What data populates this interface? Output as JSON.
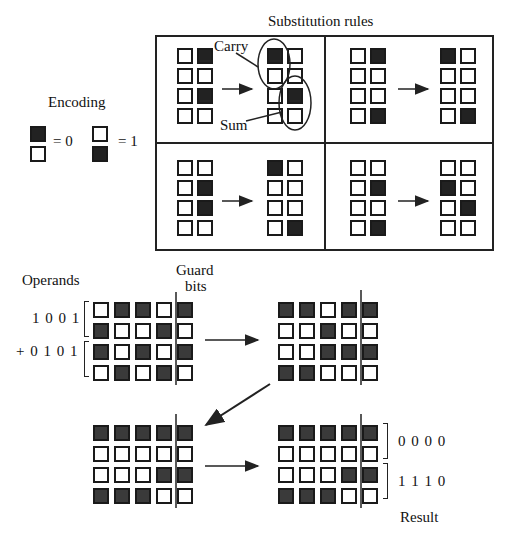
{
  "substitution_rules": {
    "title": "Substitution rules",
    "rules": [
      {
        "name": "top-left",
        "input": [
          [
            "W",
            "D"
          ],
          [
            "W",
            "W"
          ],
          [
            "W",
            "D"
          ],
          [
            "W",
            "W"
          ]
        ],
        "output": [
          [
            "D",
            "W"
          ],
          [
            "W",
            "W"
          ],
          [
            "W",
            "D"
          ],
          [
            "W",
            "W"
          ]
        ],
        "annotations": {
          "carry": "Carry",
          "sum": "Sum"
        }
      },
      {
        "name": "top-right",
        "input": [
          [
            "W",
            "D"
          ],
          [
            "W",
            "W"
          ],
          [
            "W",
            "W"
          ],
          [
            "W",
            "D"
          ]
        ],
        "output": [
          [
            "D",
            "W"
          ],
          [
            "W",
            "W"
          ],
          [
            "W",
            "W"
          ],
          [
            "W",
            "D"
          ]
        ]
      },
      {
        "name": "bottom-left",
        "input": [
          [
            "W",
            "W"
          ],
          [
            "W",
            "D"
          ],
          [
            "W",
            "D"
          ],
          [
            "W",
            "W"
          ]
        ],
        "output": [
          [
            "D",
            "W"
          ],
          [
            "W",
            "W"
          ],
          [
            "W",
            "W"
          ],
          [
            "W",
            "D"
          ]
        ]
      },
      {
        "name": "bottom-right",
        "input": [
          [
            "W",
            "W"
          ],
          [
            "W",
            "D"
          ],
          [
            "W",
            "W"
          ],
          [
            "W",
            "D"
          ]
        ],
        "output": [
          [
            "W",
            "W"
          ],
          [
            "D",
            "W"
          ],
          [
            "W",
            "D"
          ],
          [
            "W",
            "W"
          ]
        ]
      }
    ]
  },
  "encoding": {
    "title": "Encoding",
    "zero": {
      "cells": [
        "D",
        "W"
      ],
      "label": "= 0"
    },
    "one": {
      "cells": [
        "W",
        "D"
      ],
      "label": "= 1"
    }
  },
  "addition": {
    "operands_label": "Operands",
    "guard_label_line1": "Guard",
    "guard_label_line2": "bits",
    "operand_a": "1 0 0 1",
    "operand_b": "+ 0 1 0 1",
    "result_top": "0 0 0 0",
    "result_bottom": "1 1 1 0",
    "result_label": "Result",
    "grids": {
      "operands": [
        [
          "W",
          "D",
          "D",
          "W",
          "D"
        ],
        [
          "D",
          "W",
          "W",
          "D",
          "W"
        ],
        [
          "D",
          "W",
          "D",
          "W",
          "D"
        ],
        [
          "W",
          "D",
          "W",
          "D",
          "W"
        ]
      ],
      "step1": [
        [
          "D",
          "D",
          "W",
          "D",
          "D"
        ],
        [
          "W",
          "W",
          "D",
          "W",
          "W"
        ],
        [
          "W",
          "W",
          "D",
          "D",
          "D"
        ],
        [
          "D",
          "D",
          "W",
          "W",
          "W"
        ]
      ],
      "step2": [
        [
          "D",
          "D",
          "D",
          "D",
          "D"
        ],
        [
          "W",
          "W",
          "W",
          "W",
          "W"
        ],
        [
          "W",
          "W",
          "W",
          "D",
          "D"
        ],
        [
          "D",
          "D",
          "D",
          "W",
          "W"
        ]
      ],
      "result": [
        [
          "D",
          "D",
          "D",
          "D",
          "D"
        ],
        [
          "W",
          "W",
          "W",
          "W",
          "W"
        ],
        [
          "W",
          "W",
          "W",
          "D",
          "D"
        ],
        [
          "D",
          "D",
          "D",
          "W",
          "W"
        ]
      ]
    }
  },
  "colors": {
    "dark_cell": "#222222",
    "light_cell": "#ffffff",
    "line": "#222222"
  }
}
